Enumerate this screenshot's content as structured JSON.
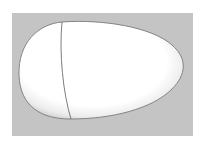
{
  "scene": {
    "subject": "3D rendered egg shape with seam line",
    "colors": {
      "page_background": "#ffffff",
      "backdrop": "#c4c4c4",
      "egg_highlight": "#ffffff",
      "egg_shade": "#d8d8d8",
      "egg_outline": "#7a7a7a",
      "seam_line": "#6e6e6e"
    }
  }
}
